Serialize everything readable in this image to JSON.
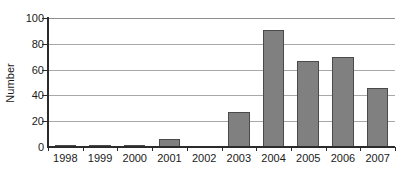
{
  "chart_data": {
    "type": "bar",
    "title": "",
    "xlabel": "",
    "ylabel": "Number",
    "categories": [
      "1998",
      "1999",
      "2000",
      "2001",
      "2002",
      "2003",
      "2004",
      "2005",
      "2006",
      "2007"
    ],
    "values": [
      1.5,
      1.5,
      0.5,
      6,
      0,
      27,
      91,
      67,
      70,
      46
    ],
    "ylim": [
      0,
      100
    ],
    "ytick_labels": [
      "0",
      "20",
      "40",
      "60",
      "80",
      "100"
    ],
    "ytick_values": [
      0,
      20,
      40,
      60,
      80,
      100
    ],
    "grid": "horizontal",
    "legend": "none",
    "bar_color": "#808080",
    "bar_border_color": "#4a4a4a",
    "gridline_color": "#a8a8a8",
    "axis_color": "#2b2b2b",
    "background": "#ffffff"
  }
}
